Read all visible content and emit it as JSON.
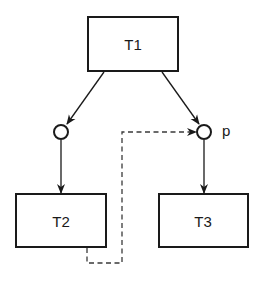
{
  "diagram": {
    "type": "petri-net",
    "transitions": [
      {
        "id": "T1",
        "label": "T1"
      },
      {
        "id": "T2",
        "label": "T2"
      },
      {
        "id": "T3",
        "label": "T3"
      }
    ],
    "places": [
      {
        "id": "place-left",
        "label": ""
      },
      {
        "id": "place-p",
        "label": "p"
      }
    ],
    "edges": [
      {
        "from": "T1",
        "to": "place-left",
        "style": "solid"
      },
      {
        "from": "T1",
        "to": "place-p",
        "style": "solid"
      },
      {
        "from": "place-left",
        "to": "T2",
        "style": "solid"
      },
      {
        "from": "place-p",
        "to": "T3",
        "style": "solid"
      },
      {
        "from": "T2",
        "to": "place-p",
        "style": "dashed"
      }
    ],
    "colors": {
      "stroke": "#1a1a1a",
      "background": "#ffffff"
    }
  }
}
